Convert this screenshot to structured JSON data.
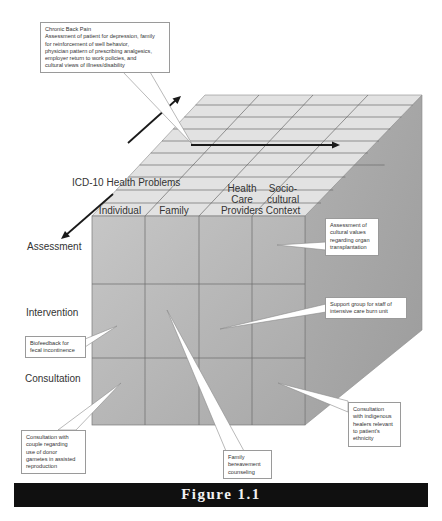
{
  "figure": {
    "caption": "Figure 1.1"
  },
  "axis": {
    "depth_label": "ICD-10 Health Problems"
  },
  "columns": [
    {
      "lines": [
        "Individual"
      ]
    },
    {
      "lines": [
        "Family"
      ]
    },
    {
      "lines": [
        "Health",
        "Care",
        "Providers"
      ]
    },
    {
      "lines": [
        "Socio-",
        "cultural",
        "Context"
      ]
    }
  ],
  "rows": [
    {
      "label": "Assessment"
    },
    {
      "label": "Intervention"
    },
    {
      "label": "Consultation"
    }
  ],
  "callouts": {
    "chronic_back_pain": {
      "lines": [
        "Chronic Back Pain",
        "Assessment of patient for depression, family",
        "for reinforcement of well behavior,",
        "physician pattern of prescribing analgesics,",
        "employer return to work policies, and",
        "cultural views of illness/disability"
      ]
    },
    "organ_transplantation": {
      "lines": [
        "Assessment of",
        "cultural values",
        "regarding organ",
        "transplantation"
      ]
    },
    "burn_unit": {
      "lines": [
        "Support group for staff of",
        "intensive care burn unit"
      ]
    },
    "biofeedback": {
      "lines": [
        "Biofeedback for",
        "fecal incontinence"
      ]
    },
    "donor_gametes": {
      "lines": [
        "Consultation with",
        "couple regarding",
        "use of donor",
        "gametes in assisted",
        "reproduction"
      ]
    },
    "bereavement": {
      "lines": [
        "Family",
        "bereavement",
        "counseling"
      ]
    },
    "indigenous_healers": {
      "lines": [
        "Consultation",
        "with indigenous",
        "healers relevant",
        "to patient's",
        "ethnicity"
      ]
    }
  },
  "colors": {
    "front_face": "#b9b9b9",
    "top_face": "#e2e2e2",
    "side_face": "#a9a9a9",
    "grid_line": "#6a6a6a",
    "arrow": "#1a1a1a",
    "caption_bar": "#101010",
    "caption_text": "#f2f2f2"
  }
}
